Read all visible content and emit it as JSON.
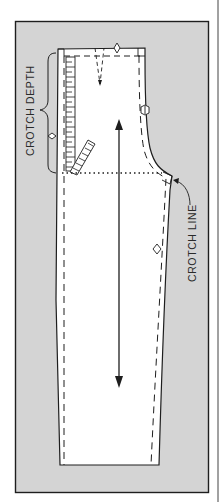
{
  "diagram": {
    "type": "sewing-pattern",
    "labels": {
      "crotch_depth": "CROTCH DEPTH",
      "crotch_line": "CROTCH LINE"
    },
    "colors": {
      "background": "#ffffff",
      "shaded_area": "#d4d4d4",
      "pattern_piece": "#ffffff",
      "ink": "#1e1e1e"
    },
    "elements": [
      "outer-frame",
      "pattern-piece-outline",
      "seam-allowance-dashed-lines",
      "waist-dart",
      "waist-notch",
      "side-notch",
      "inseam-notch",
      "crotch-depth-brace",
      "crotch-depth-notch",
      "ruler",
      "crotch-line-dotted",
      "grainline-arrow"
    ]
  }
}
